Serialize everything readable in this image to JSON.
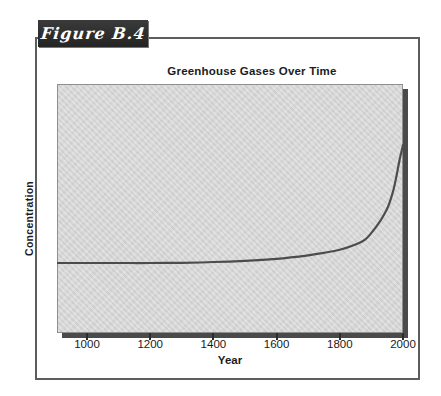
{
  "figure": {
    "label": "Figure B.4",
    "title": "Greenhouse Gases Over Time",
    "xlabel": "Year",
    "ylabel": "Concentration"
  },
  "colors": {
    "curve": "#4c4c50",
    "plot_bg": "#d8d8d8",
    "plot_shadow": "#4a4a4a",
    "label_box_bg": "#2e2e2e",
    "label_box_text": "#ffffff",
    "outer_border": "#5d5d5d",
    "text": "#1a1a1a"
  },
  "chart_data": {
    "type": "line",
    "title": "Greenhouse Gases Over Time",
    "xlabel": "Year",
    "ylabel": "Concentration",
    "x_ticks": [
      1000,
      1200,
      1400,
      1600,
      1800,
      2000
    ],
    "xlim": [
      905,
      2000
    ],
    "ylim": [
      0,
      1
    ],
    "grid": false,
    "legend": "none",
    "y_tick_labels_shown": false,
    "points": [
      [
        905,
        0.281
      ],
      [
        1000,
        0.281
      ],
      [
        1100,
        0.281
      ],
      [
        1200,
        0.281
      ],
      [
        1300,
        0.282
      ],
      [
        1400,
        0.285
      ],
      [
        1500,
        0.29
      ],
      [
        1600,
        0.298
      ],
      [
        1700,
        0.312
      ],
      [
        1750,
        0.322
      ],
      [
        1800,
        0.334
      ],
      [
        1850,
        0.355
      ],
      [
        1880,
        0.375
      ],
      [
        1900,
        0.402
      ],
      [
        1920,
        0.435
      ],
      [
        1940,
        0.475
      ],
      [
        1955,
        0.515
      ],
      [
        1970,
        0.575
      ],
      [
        1980,
        0.635
      ],
      [
        1990,
        0.7
      ],
      [
        2000,
        0.755
      ]
    ]
  }
}
